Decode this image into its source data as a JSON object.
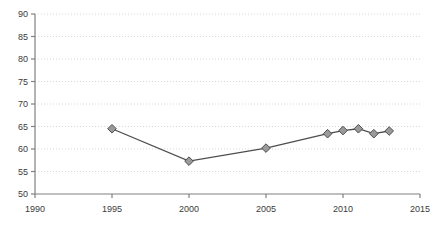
{
  "chart_data": {
    "type": "line",
    "title": "",
    "subtitle": "",
    "xlabel": "",
    "ylabel": "",
    "xlim": [
      1990,
      2015
    ],
    "ylim": [
      50,
      90
    ],
    "grid": true,
    "grid_axis": "y",
    "legend": false,
    "legend_position": "none",
    "x_ticks": [
      1990,
      1995,
      2000,
      2005,
      2010,
      2015
    ],
    "x_tick_labels": [
      "1990",
      "1995",
      "2000",
      "2005",
      "2010",
      "2015"
    ],
    "y_ticks": [
      50,
      55,
      60,
      65,
      70,
      75,
      80,
      85,
      90
    ],
    "y_tick_labels": [
      "50",
      "55",
      "60",
      "65",
      "70",
      "75",
      "80",
      "85",
      "90"
    ],
    "series": [
      {
        "name": "series-1",
        "marker": "diamond",
        "marker_fill": "#9a9a9a",
        "marker_edge": "#4d4d4d",
        "line_color": "#4d4d4d",
        "x": [
          1995,
          2000,
          2005,
          2009,
          2010,
          2011,
          2012,
          2013
        ],
        "values": [
          64.5,
          57.3,
          60.2,
          63.4,
          64.1,
          64.5,
          63.4,
          64.0
        ],
        "points": [
          {
            "x": 1995,
            "y": 64.5
          },
          {
            "x": 2000,
            "y": 57.3
          },
          {
            "x": 2005,
            "y": 60.2
          },
          {
            "x": 2009,
            "y": 63.4
          },
          {
            "x": 2010,
            "y": 64.1
          },
          {
            "x": 2011,
            "y": 64.5
          },
          {
            "x": 2012,
            "y": 63.4
          },
          {
            "x": 2013,
            "y": 64.0
          }
        ]
      }
    ],
    "colors": {
      "background": "#ffffff",
      "axis": "#808080",
      "gridline": "#d8d8d8",
      "tick_text": "#3a3a3a",
      "line": "#4d4d4d",
      "marker_fill": "#9a9a9a",
      "marker_edge": "#4d4d4d"
    }
  }
}
